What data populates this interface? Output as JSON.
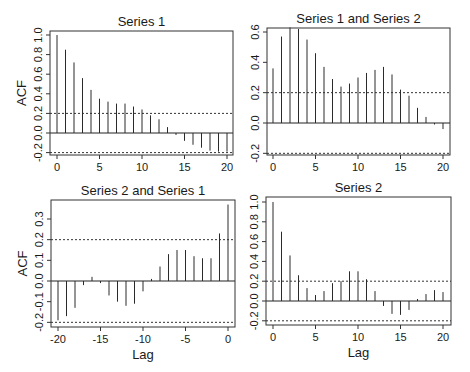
{
  "chart_data": [
    {
      "type": "bar",
      "subtype": "acf-stem",
      "title": "Series 1",
      "xlabel": "",
      "ylabel": "ACF",
      "x": [
        0,
        1,
        2,
        3,
        4,
        5,
        6,
        7,
        8,
        9,
        10,
        11,
        12,
        13,
        14,
        15,
        16,
        17,
        18,
        19,
        20
      ],
      "values": [
        1.0,
        0.85,
        0.72,
        0.56,
        0.44,
        0.35,
        0.32,
        0.3,
        0.3,
        0.27,
        0.24,
        0.18,
        0.14,
        0.06,
        -0.02,
        -0.08,
        -0.12,
        -0.15,
        -0.18,
        -0.19,
        -0.19
      ],
      "ci": [
        0.2,
        -0.2
      ],
      "xlim": [
        -0.8,
        21
      ],
      "ylim": [
        -0.25,
        1.04
      ],
      "xticks": [
        0,
        5,
        10,
        15,
        20
      ],
      "yticks": [
        -0.2,
        0.0,
        0.2,
        0.4,
        0.6,
        0.8,
        1.0
      ],
      "ytick_labels": [
        "-0.2",
        "0.0",
        "0.2",
        "0.4",
        "0.6",
        "0.8",
        "1.0"
      ],
      "grid": false
    },
    {
      "type": "bar",
      "subtype": "acf-stem",
      "title": "Series 1 and Series 2",
      "xlabel": "",
      "ylabel": "",
      "x": [
        0,
        1,
        2,
        3,
        4,
        5,
        6,
        7,
        8,
        9,
        10,
        11,
        12,
        13,
        14,
        15,
        16,
        17,
        18,
        19,
        20
      ],
      "values": [
        0.36,
        0.57,
        0.63,
        0.62,
        0.55,
        0.46,
        0.37,
        0.29,
        0.24,
        0.26,
        0.3,
        0.33,
        0.35,
        0.37,
        0.32,
        0.22,
        0.18,
        0.1,
        0.04,
        -0.01,
        -0.04
      ],
      "ci": [
        0.2,
        -0.2
      ],
      "xlim": [
        -0.8,
        21
      ],
      "ylim": [
        -0.22,
        0.64
      ],
      "xticks": [
        0,
        5,
        10,
        15,
        20
      ],
      "yticks": [
        -0.2,
        0.0,
        0.2,
        0.4,
        0.6
      ],
      "ytick_labels": [
        "-0.2",
        "0.0",
        "0.2",
        "0.4",
        "0.6"
      ],
      "grid": false
    },
    {
      "type": "bar",
      "subtype": "acf-stem",
      "title": "Series 2 and Series 1",
      "xlabel": "Lag",
      "ylabel": "ACF",
      "x": [
        -20,
        -19,
        -18,
        -17,
        -16,
        -15,
        -14,
        -13,
        -12,
        -11,
        -10,
        -9,
        -8,
        -7,
        -6,
        -5,
        -4,
        -3,
        -2,
        -1,
        0
      ],
      "values": [
        -0.19,
        -0.17,
        -0.13,
        -0.02,
        0.02,
        -0.01,
        -0.07,
        -0.1,
        -0.12,
        -0.11,
        -0.05,
        0.01,
        0.07,
        0.13,
        0.15,
        0.15,
        0.12,
        0.11,
        0.11,
        0.23,
        0.37
      ],
      "ci": [
        0.2,
        -0.2
      ],
      "xlim": [
        -21,
        0.8
      ],
      "ylim": [
        -0.22,
        0.39
      ],
      "xticks": [
        -20,
        -15,
        -10,
        -5,
        0
      ],
      "yticks": [
        -0.2,
        -0.1,
        0.0,
        0.1,
        0.2,
        0.3
      ],
      "ytick_labels": [
        "-0.2",
        "-0.1",
        "0.0",
        "0.1",
        "0.2",
        "0.3"
      ],
      "grid": false
    },
    {
      "type": "bar",
      "subtype": "acf-stem",
      "title": "Series 2",
      "xlabel": "Lag",
      "ylabel": "",
      "x": [
        0,
        1,
        2,
        3,
        4,
        5,
        6,
        7,
        8,
        9,
        10,
        11,
        12,
        13,
        14,
        15,
        16,
        17,
        18,
        19,
        20
      ],
      "values": [
        1.0,
        0.7,
        0.46,
        0.26,
        0.13,
        0.06,
        0.1,
        0.18,
        0.2,
        0.3,
        0.3,
        0.22,
        0.1,
        -0.05,
        -0.13,
        -0.14,
        -0.09,
        0.02,
        0.07,
        0.11,
        0.09
      ],
      "ci": [
        0.2,
        -0.2
      ],
      "xlim": [
        -0.8,
        21
      ],
      "ylim": [
        -0.25,
        1.04
      ],
      "xticks": [
        0,
        5,
        10,
        15,
        20
      ],
      "yticks": [
        -0.2,
        0.0,
        0.2,
        0.4,
        0.6,
        0.8,
        1.0
      ],
      "ytick_labels": [
        "-0.2",
        "0.0",
        "0.2",
        "0.4",
        "0.6",
        "0.8",
        "1.0"
      ],
      "grid": false
    }
  ]
}
